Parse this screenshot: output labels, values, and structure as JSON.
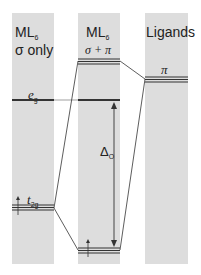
{
  "columns": [
    {
      "title": "ML",
      "title_sub": "6",
      "subtitle": "σ only"
    },
    {
      "title": "ML",
      "title_sub": "6",
      "subtitle": "σ + π"
    },
    {
      "title": "Ligands"
    }
  ],
  "levels": {
    "eg_label": "e",
    "eg_sub": "g",
    "t2g_label": "t",
    "t2g_sub": "2g",
    "pi_label": "π",
    "delta_label": "Δ",
    "delta_sub": "O"
  },
  "colors": {
    "column_bg": "#dddddd",
    "line": "#333333"
  }
}
